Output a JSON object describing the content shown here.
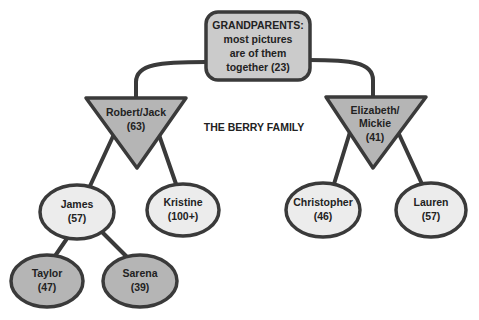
{
  "diagram": {
    "title": "THE BERRY FAMILY",
    "colors": {
      "stroke": "#3a3a3a",
      "dark_fill": "#b5b5b5",
      "light_fill": "#ececec",
      "box_fill": "#cbcbcb",
      "text": "#222222"
    },
    "nodes": {
      "grandparents": {
        "shape": "rounded-rect",
        "lines": [
          "GRANDPARENTS:",
          "most pictures",
          "are of them",
          "together (23)"
        ]
      },
      "robert_jack": {
        "shape": "inverted-triangle",
        "lines": [
          "Robert/Jack",
          "(63)"
        ]
      },
      "elizabeth_mickie": {
        "shape": "inverted-triangle",
        "lines": [
          "Elizabeth/",
          "Mickie",
          "(41)"
        ]
      },
      "james": {
        "shape": "ellipse",
        "lines": [
          "James",
          "(57)"
        ]
      },
      "kristine": {
        "shape": "ellipse",
        "lines": [
          "Kristine",
          "(100+)"
        ]
      },
      "christopher": {
        "shape": "ellipse",
        "lines": [
          "Christopher",
          "(46)"
        ]
      },
      "lauren": {
        "shape": "ellipse",
        "lines": [
          "Lauren",
          "(57)"
        ]
      },
      "taylor": {
        "shape": "ellipse",
        "lines": [
          "Taylor",
          "(47)"
        ]
      },
      "sarena": {
        "shape": "ellipse",
        "lines": [
          "Sarena",
          "(39)"
        ]
      }
    },
    "edges": [
      [
        "grandparents",
        "robert_jack"
      ],
      [
        "grandparents",
        "elizabeth_mickie"
      ],
      [
        "robert_jack",
        "james"
      ],
      [
        "robert_jack",
        "kristine"
      ],
      [
        "elizabeth_mickie",
        "christopher"
      ],
      [
        "elizabeth_mickie",
        "lauren"
      ],
      [
        "james",
        "taylor"
      ],
      [
        "james",
        "sarena"
      ]
    ]
  }
}
